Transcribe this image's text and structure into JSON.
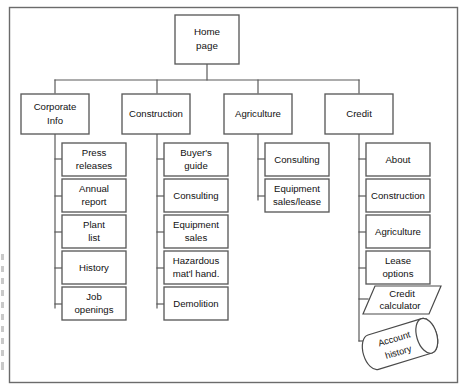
{
  "diagram": {
    "type": "site-map-tree",
    "root": {
      "id": "home",
      "label": "Home page",
      "lines": [
        "Home",
        "page"
      ],
      "shape": "rectangle"
    },
    "branches": [
      {
        "id": "corporate-info",
        "label": "Corporate Info",
        "lines": [
          "Corporate",
          "Info"
        ],
        "shape": "rectangle",
        "children": [
          {
            "id": "press-releases",
            "label": "Press releases",
            "lines": [
              "Press",
              "releases"
            ],
            "shape": "rectangle"
          },
          {
            "id": "annual-report",
            "label": "Annual report",
            "lines": [
              "Annual",
              "report"
            ],
            "shape": "rectangle"
          },
          {
            "id": "plant-list",
            "label": "Plant list",
            "lines": [
              "Plant",
              "list"
            ],
            "shape": "rectangle"
          },
          {
            "id": "history",
            "label": "History",
            "lines": [
              "History"
            ],
            "shape": "rectangle"
          },
          {
            "id": "job-openings",
            "label": "Job openings",
            "lines": [
              "Job",
              "openings"
            ],
            "shape": "rectangle"
          }
        ]
      },
      {
        "id": "construction",
        "label": "Construction",
        "lines": [
          "Construction"
        ],
        "shape": "rectangle",
        "children": [
          {
            "id": "buyers-guide",
            "label": "Buyer's guide",
            "lines": [
              "Buyer's",
              "guide"
            ],
            "shape": "rectangle"
          },
          {
            "id": "construction-consulting",
            "label": "Consulting",
            "lines": [
              "Consulting"
            ],
            "shape": "rectangle"
          },
          {
            "id": "equipment-sales",
            "label": "Equipment sales",
            "lines": [
              "Equipment",
              "sales"
            ],
            "shape": "rectangle"
          },
          {
            "id": "hazardous-material-handling",
            "label": "Hazardous mat'l hand.",
            "lines": [
              "Hazardous",
              "mat'l hand."
            ],
            "shape": "rectangle"
          },
          {
            "id": "demolition",
            "label": "Demolition",
            "lines": [
              "Demolition"
            ],
            "shape": "rectangle"
          }
        ]
      },
      {
        "id": "agriculture",
        "label": "Agriculture",
        "lines": [
          "Agriculture"
        ],
        "shape": "rectangle",
        "children": [
          {
            "id": "agriculture-consulting",
            "label": "Consulting",
            "lines": [
              "Consulting"
            ],
            "shape": "rectangle"
          },
          {
            "id": "equipment-sales-lease",
            "label": "Equipment sales/lease",
            "lines": [
              "Equipment",
              "sales/lease"
            ],
            "shape": "rectangle"
          }
        ]
      },
      {
        "id": "credit",
        "label": "Credit",
        "lines": [
          "Credit"
        ],
        "shape": "rectangle",
        "children": [
          {
            "id": "credit-about",
            "label": "About",
            "lines": [
              "About"
            ],
            "shape": "rectangle"
          },
          {
            "id": "credit-construction",
            "label": "Construction",
            "lines": [
              "Construction"
            ],
            "shape": "rectangle"
          },
          {
            "id": "credit-agriculture",
            "label": "Agriculture",
            "lines": [
              "Agriculture"
            ],
            "shape": "rectangle"
          },
          {
            "id": "lease-options",
            "label": "Lease options",
            "lines": [
              "Lease",
              "options"
            ],
            "shape": "rectangle"
          },
          {
            "id": "credit-calculator",
            "label": "Credit calculator",
            "lines": [
              "Credit",
              "calculator"
            ],
            "shape": "parallelogram"
          },
          {
            "id": "account-history",
            "label": "Account history",
            "lines": [
              "Account",
              "history"
            ],
            "shape": "cylinder"
          }
        ]
      }
    ]
  },
  "colors": {
    "background": "#ffffff",
    "box_stroke": "#5a5a5a",
    "frame_stroke": "#6b6b6b",
    "text": "#111111"
  }
}
